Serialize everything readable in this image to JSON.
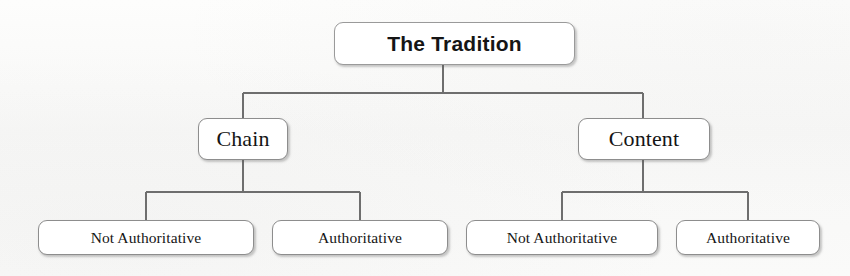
{
  "diagram": {
    "type": "hierarchy-tree",
    "title": "The Tradition",
    "levels": 3,
    "colors": {
      "background": "#fbfbfa",
      "node_fill": "#ffffff",
      "node_border": "#8d8d8d",
      "connector": "#6e6e6e",
      "text": "#151515"
    },
    "root": {
      "label": "The Tradition",
      "x": 334,
      "y": 22,
      "width": 241,
      "height": 43
    },
    "branches": [
      {
        "label": "Chain",
        "x": 198,
        "y": 118,
        "width": 90,
        "height": 42,
        "children": [
          {
            "label": "Not Authoritative",
            "x": 38,
            "y": 220,
            "width": 216,
            "height": 35
          },
          {
            "label": "Authoritative",
            "x": 272,
            "y": 220,
            "width": 176,
            "height": 35
          }
        ]
      },
      {
        "label": "Content",
        "x": 578,
        "y": 118,
        "width": 132,
        "height": 42,
        "children": [
          {
            "label": "Not Authoritative",
            "x": 466,
            "y": 220,
            "width": 192,
            "height": 35
          },
          {
            "label": "Authoritative",
            "x": 676,
            "y": 220,
            "width": 144,
            "height": 35
          }
        ]
      }
    ],
    "connectors": {
      "root_stem_x": 443,
      "root_bus_y": 93,
      "root_bus_left": 243,
      "root_bus_right": 643,
      "child_bus_y": 192,
      "left_bus_left": 146,
      "left_bus_right": 360,
      "right_bus_left": 562,
      "right_bus_right": 748
    }
  }
}
